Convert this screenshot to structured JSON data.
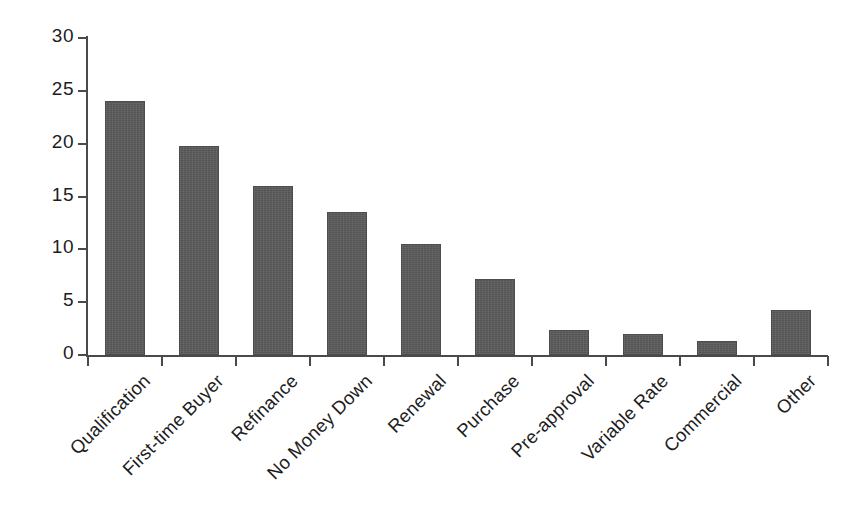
{
  "chart_data": {
    "type": "bar",
    "title": "",
    "xlabel": "",
    "ylabel": "",
    "ylim": [
      0,
      30
    ],
    "y_ticks": [
      0,
      5,
      10,
      15,
      20,
      25,
      30
    ],
    "grid": false,
    "legend": null,
    "bar_color": "#5b5b5b",
    "axis_color": "#4a4a4a",
    "text_color": "#1d1d1d",
    "categories": [
      "Qualification",
      "First-time Buyer",
      "Refinance",
      "No Money Down",
      "Renewal",
      "Purchase",
      "Pre-approval",
      "Variable Rate",
      "Commercial",
      "Other"
    ],
    "values": [
      24.0,
      19.8,
      16.0,
      13.5,
      10.5,
      7.2,
      2.4,
      2.0,
      1.3,
      4.3
    ]
  },
  "axis": {
    "y_tick_labels": [
      "0",
      "5",
      "10",
      "15",
      "20",
      "25",
      "30"
    ]
  }
}
